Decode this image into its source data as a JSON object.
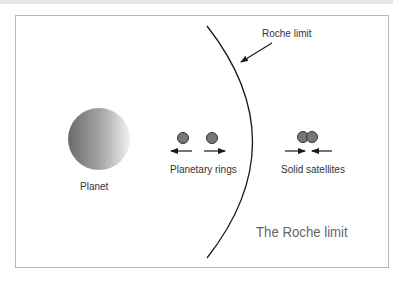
{
  "diagram": {
    "title": "The Roche limit",
    "roche_label": "Roche limit",
    "planet_label": "Planet",
    "rings_label": "Planetary rings",
    "satellites_label": "Solid satellites"
  },
  "colors": {
    "line": "#1a1a1a",
    "moon": "#777777",
    "frame": "#b8b8b8",
    "title": "#666666"
  }
}
